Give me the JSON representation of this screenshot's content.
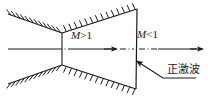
{
  "figure": {
    "background_color": "#ffffff",
    "line_color": "#1a1a1a"
  },
  "labels": {
    "mach_supersonic": {
      "symbol": "M",
      "relation": ">1",
      "text": "M>1"
    },
    "mach_subsonic": {
      "symbol": "M",
      "relation": "<1",
      "text": "M<1"
    },
    "shock": {
      "text": "正激波"
    }
  },
  "elements": {
    "upper_wall": "hatched-wall-upper",
    "lower_wall": "hatched-wall-lower",
    "throat_line": "throat",
    "shock_line": "normal-shock",
    "centerline": "axis-centerline",
    "flow_arrows": "flow-direction-arrows",
    "leader": "shock-leader-arrow"
  }
}
